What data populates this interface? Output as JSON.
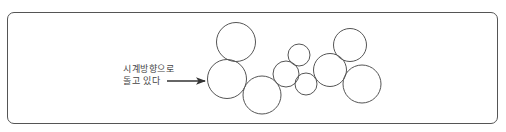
{
  "diagram": {
    "annotation": {
      "line1": "시계방향으로",
      "line2": "돌고 있다"
    },
    "arrow": {
      "x1": 167,
      "y1": 81,
      "x2": 205,
      "y2": 81
    },
    "circles": [
      {
        "cx": 236,
        "cy": 42,
        "r": 19.5
      },
      {
        "cx": 227,
        "cy": 79,
        "r": 19.5
      },
      {
        "cx": 262,
        "cy": 95,
        "r": 19
      },
      {
        "cx": 286,
        "cy": 74,
        "r": 13
      },
      {
        "cx": 299,
        "cy": 55,
        "r": 11
      },
      {
        "cx": 306,
        "cy": 84,
        "r": 11
      },
      {
        "cx": 330,
        "cy": 70,
        "r": 16.5
      },
      {
        "cx": 350,
        "cy": 45,
        "r": 16.5
      },
      {
        "cx": 362,
        "cy": 84,
        "r": 19
      }
    ],
    "colors": {
      "stroke": "#555555",
      "text": "#444444"
    }
  }
}
